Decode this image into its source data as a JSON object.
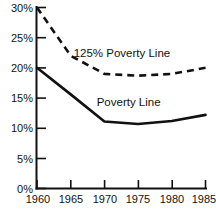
{
  "chart_data": {
    "type": "line",
    "title": "",
    "xlabel": "",
    "ylabel": "",
    "x": [
      1960,
      1965,
      1970,
      1975,
      1980,
      1985
    ],
    "xlim": [
      1960,
      1985
    ],
    "ylim": [
      0,
      30
    ],
    "xtick_labels": [
      "1960",
      "1965",
      "1970",
      "1975",
      "1980",
      "1985"
    ],
    "ytick_labels": [
      "0%",
      "5%",
      "10%",
      "15%",
      "20%",
      "25%",
      "30%"
    ],
    "ytick_values": [
      0,
      5,
      10,
      15,
      20,
      25,
      30
    ],
    "grid": false,
    "legend_position": "inline-annotations",
    "series": [
      {
        "name": "125% Poverty Line",
        "style": "dashed",
        "values": [
          30.0,
          22.0,
          19.0,
          18.7,
          19.0,
          20.0
        ],
        "label_x": 1972.6,
        "label_y": 21.8
      },
      {
        "name": "Poverty Line",
        "style": "solid",
        "values": [
          20.0,
          15.6,
          11.1,
          10.7,
          11.2,
          12.2
        ],
        "label_x": 1973.6,
        "label_y": 13.6
      }
    ],
    "annotations": [
      {
        "text": "125% Poverty Line"
      },
      {
        "text": "Poverty Line"
      }
    ]
  }
}
